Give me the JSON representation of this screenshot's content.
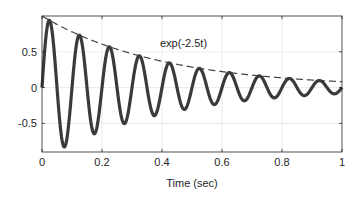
{
  "chart_data": {
    "type": "line",
    "title": "",
    "xlabel": "Time (sec)",
    "ylabel": "",
    "xlim": [
      0,
      1
    ],
    "ylim": [
      -0.9,
      1.0
    ],
    "xticks": [
      0,
      0.2,
      0.4,
      0.6,
      0.8,
      1
    ],
    "xtick_labels": [
      "0",
      "0.2",
      "0.4",
      "0.6",
      "0.8",
      "1"
    ],
    "yticks": [
      -0.5,
      0,
      0.5
    ],
    "ytick_labels": [
      "-0.5",
      "0",
      "0.5"
    ],
    "grid": true,
    "series": [
      {
        "name": "damped sine",
        "expression": "exp(-2.5t)*sin(2*pi*10*t)",
        "style": "solid thick",
        "color": "#3a3a3a"
      },
      {
        "name": "envelope",
        "expression": "exp(-2.5t)",
        "style": "dashed",
        "color": "#3a3a3a"
      }
    ],
    "annotations": [
      {
        "text": "exp(-2.5t)",
        "x": 0.4,
        "y": 0.62
      }
    ]
  }
}
